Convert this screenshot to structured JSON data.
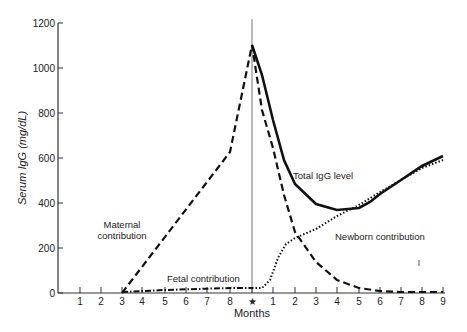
{
  "chart_data": {
    "type": "line",
    "title": "",
    "xlabel": "Months",
    "ylabel": "Serum IgG (mg/dL)",
    "ylim": [
      0,
      1200
    ],
    "yticks": [
      0,
      200,
      400,
      600,
      800,
      1000,
      1200
    ],
    "xtick_labels": [
      "1",
      "2",
      "3",
      "4",
      "5",
      "6",
      "7",
      "8",
      "★",
      "1",
      "2",
      "3",
      "4",
      "5",
      "6",
      "7",
      "8",
      "9"
    ],
    "birth_marker": "★",
    "grid": false,
    "series": [
      {
        "name": "Maternal contribution",
        "style": "dashed",
        "x": [
          "3 (prenatal)",
          "8 (prenatal)",
          "birth",
          "1",
          "2",
          "3",
          "4",
          "5",
          "6",
          "7",
          "8",
          "9"
        ],
        "values": [
          0,
          630,
          1100,
          640,
          270,
          130,
          60,
          25,
          10,
          5,
          5,
          5
        ]
      },
      {
        "name": "Fetal contribution",
        "style": "dash-dot",
        "x": [
          "3 (prenatal)",
          "5 (prenatal)",
          "8 (prenatal)",
          "birth"
        ],
        "values": [
          0,
          10,
          20,
          20
        ]
      },
      {
        "name": "Newborn contribution",
        "style": "dotted",
        "x": [
          "birth",
          "0.5",
          "1",
          "1.5",
          "2",
          "3",
          "4",
          "5",
          "6",
          "7",
          "8",
          "9"
        ],
        "values": [
          20,
          25,
          150,
          250,
          290,
          320,
          350,
          390,
          440,
          490,
          540,
          590
        ]
      },
      {
        "name": "Total IgG level",
        "style": "solid",
        "x": [
          "birth",
          "1",
          "2",
          "3",
          "4",
          "5",
          "6",
          "7",
          "8",
          "9"
        ],
        "values": [
          1100,
          700,
          480,
          380,
          350,
          380,
          430,
          490,
          550,
          610
        ]
      }
    ],
    "annotations": [
      "Maternal contribution",
      "Fetal contribution",
      "Total IgG level",
      "Newborn contribution"
    ]
  },
  "labels": {
    "maternal_1": "Maternal",
    "maternal_2": "contribution",
    "fetal": "Fetal contribution",
    "total": "Total IgG level",
    "newborn": "Newborn contribution",
    "xaxis": "Months",
    "yaxis": "Serum IgG (mg/dL)"
  }
}
